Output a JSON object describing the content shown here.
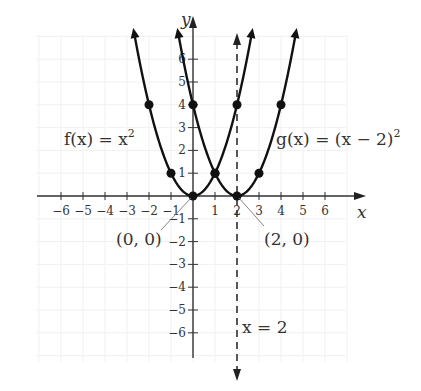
{
  "chart_data": {
    "type": "line",
    "title": "",
    "xlabel": "x",
    "ylabel": "y",
    "xlim": [
      -6.5,
      6.8
    ],
    "ylim": [
      -6.8,
      7
    ],
    "grid": true,
    "x_ticks": [
      -6,
      -5,
      -4,
      -3,
      -2,
      -1,
      1,
      2,
      3,
      4,
      5,
      6
    ],
    "x_tick_labels": [
      "−6",
      "−5",
      "−4",
      "−3",
      "−2",
      "−1",
      "1",
      "2",
      "3",
      "4",
      "5",
      "6"
    ],
    "y_ticks": [
      6,
      5,
      4,
      3,
      2,
      1,
      -1,
      -2,
      -3,
      -4,
      -5,
      -6
    ],
    "y_tick_labels": [
      "6",
      "5",
      "4",
      "3",
      "2",
      "1",
      "−1",
      "−2",
      "−3",
      "−4",
      "−5",
      "−6"
    ],
    "series": [
      {
        "name": "f(x) = x^2",
        "label": "f(x) = x²",
        "equation": "x^2",
        "points": [
          [
            -2,
            4
          ],
          [
            -1,
            1
          ],
          [
            0,
            0
          ],
          [
            1,
            1
          ],
          [
            2,
            4
          ]
        ],
        "x_range": [
          -2.65,
          2.65
        ]
      },
      {
        "name": "g(x) = (x − 2)^2",
        "label": "g(x) = (x − 2)²",
        "equation": "(x-2)^2",
        "points": [
          [
            0,
            4
          ],
          [
            1,
            1
          ],
          [
            2,
            0
          ],
          [
            3,
            1
          ],
          [
            4,
            4
          ]
        ],
        "x_range": [
          -0.65,
          4.65
        ]
      }
    ],
    "asymptote_lines": [
      {
        "type": "vertical",
        "x": 2,
        "style": "dashed",
        "label": "x = 2"
      }
    ],
    "annotations": [
      {
        "text": "(0, 0)",
        "points_to": [
          0,
          0
        ]
      },
      {
        "text": "(2, 0)",
        "points_to": [
          2,
          0
        ]
      },
      {
        "text": "x = 2",
        "near": [
          2,
          -5
        ]
      }
    ]
  },
  "labels": {
    "y_axis": "y",
    "x_axis": "x",
    "f_label_prefix": "f(x) = x",
    "f_label_exp": "2",
    "g_label_prefix": "g(x) = (x − 2)",
    "g_label_exp": "2",
    "vertex_f": "(0, 0)",
    "vertex_g": "(2, 0)",
    "axis_of_symmetry": "x = 2"
  }
}
